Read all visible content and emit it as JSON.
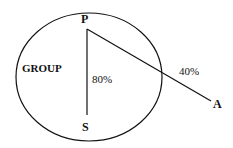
{
  "diagram": {
    "group_label": "GROUP",
    "points": {
      "p": "P",
      "s": "S",
      "a": "A"
    },
    "edges": [
      {
        "from": "P",
        "to": "S",
        "label": "80%"
      },
      {
        "from": "P",
        "to": "A",
        "label": "40%"
      }
    ],
    "colors": {
      "stroke": "#111111",
      "background": "#ffffff"
    }
  }
}
